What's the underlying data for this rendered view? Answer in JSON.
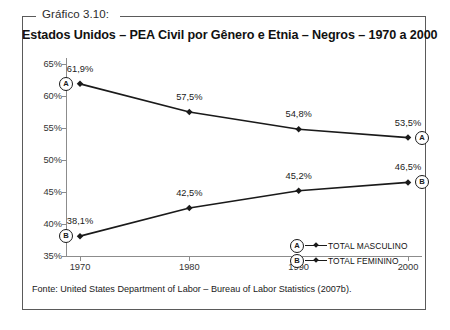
{
  "figure": {
    "caption": "Gráfico 3.10:",
    "title": "Estados Unidos – PEA Civil por Gênero e Etnia – Negros – 1970 a 2000",
    "source": "Fonte: United States Department of Labor – Bureau of Labor Statistics (2007b)."
  },
  "chart_data": {
    "type": "line",
    "title": "Estados Unidos – PEA Civil por Gênero e Etnia – Negros – 1970 a 2000",
    "xlabel": "",
    "ylabel": "",
    "categories": [
      "1970",
      "1980",
      "1990",
      "2000"
    ],
    "x": [
      1970,
      1980,
      1990,
      2000
    ],
    "ylim": [
      35,
      65
    ],
    "yticks": [
      35,
      40,
      45,
      50,
      55,
      60,
      65
    ],
    "ytick_labels": [
      "35%",
      "40%",
      "45%",
      "50%",
      "55%",
      "60%",
      "65%"
    ],
    "grid": false,
    "legend_position": "lower-right",
    "series": [
      {
        "name": "TOTAL MASCULINO",
        "key": "A",
        "values": [
          61.9,
          57.5,
          54.8,
          53.5
        ],
        "data_labels": [
          "61,9%",
          "57,5%",
          "54,8%",
          "53,5%"
        ],
        "color": "#1a1a1a"
      },
      {
        "name": "TOTAL FEMININO",
        "key": "B",
        "values": [
          38.1,
          42.5,
          45.2,
          46.5
        ],
        "data_labels": [
          "38,1%",
          "42,5%",
          "45,2%",
          "46,5%"
        ],
        "color": "#1a1a1a"
      }
    ]
  }
}
